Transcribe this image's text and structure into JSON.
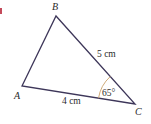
{
  "figure": {
    "type": "triangle",
    "vertices": {
      "A": {
        "label": "A"
      },
      "B": {
        "label": "B"
      },
      "C": {
        "label": "C"
      }
    },
    "sides": {
      "BC": {
        "label": "5 cm",
        "length_cm": 5
      },
      "AC": {
        "label": "4 cm",
        "length_cm": 4
      }
    },
    "angles": {
      "C": {
        "label": "65°",
        "degrees": 65
      }
    },
    "colors": {
      "line": "#3d3659",
      "arc": "#c9a06a",
      "text": "#2a2a2a",
      "marker": "#c44a5a"
    }
  }
}
